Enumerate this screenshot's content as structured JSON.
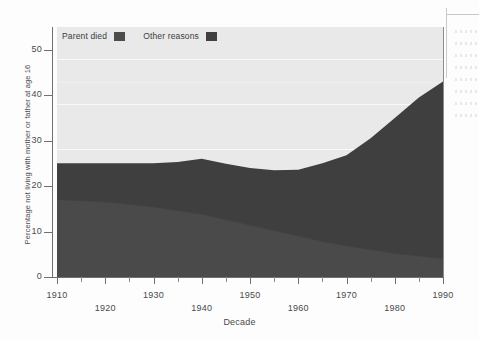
{
  "figure": {
    "ytitle": "Percentage not living with mother or father at age 16",
    "xtitle": "Decade"
  },
  "legend": {
    "items": [
      {
        "label": "Parent died",
        "color": "#4c4c4c",
        "swatch_name": "legend-swatch-parent-died"
      },
      {
        "label": "Other reasons",
        "color": "#3f3f3f",
        "swatch_name": "legend-swatch-other-reasons"
      }
    ]
  },
  "axes": {
    "y_ticks": [
      "0",
      "10",
      "20",
      "30",
      "40",
      "50"
    ],
    "x_ticks": [
      "1910",
      "1920",
      "1930",
      "1940",
      "1950",
      "1960",
      "1970",
      "1980",
      "1990"
    ]
  },
  "chart_data": {
    "type": "area",
    "title": "",
    "subtitle": "",
    "xlabel": "Decade",
    "ylabel": "Percentage not living with mother or father at age 16",
    "xlim": [
      1910,
      1990
    ],
    "ylim": [
      0,
      55
    ],
    "grid": true,
    "legend_position": "top-left",
    "stacked": true,
    "categories": [
      1910,
      1915,
      1920,
      1925,
      1930,
      1935,
      1940,
      1945,
      1950,
      1955,
      1960,
      1965,
      1970,
      1975,
      1980,
      1985,
      1990
    ],
    "series": [
      {
        "name": "Parent died",
        "color": "#4c4c4c",
        "values": [
          17.0,
          16.8,
          16.5,
          16.0,
          15.4,
          14.6,
          13.8,
          12.6,
          11.4,
          10.2,
          9.0,
          7.8,
          6.8,
          6.0,
          5.2,
          4.6,
          4.0
        ]
      },
      {
        "name": "Other reasons",
        "color": "#3f3f3f",
        "values": [
          8.0,
          8.2,
          8.5,
          9.0,
          9.6,
          10.7,
          12.2,
          12.3,
          12.6,
          13.3,
          14.6,
          17.2,
          20.0,
          24.5,
          29.8,
          34.9,
          39.0
        ]
      }
    ],
    "totals": [
      25.0,
      25.0,
      25.0,
      25.0,
      25.0,
      25.3,
      26.0,
      24.9,
      24.0,
      23.5,
      23.6,
      25.0,
      26.8,
      30.5,
      35.0,
      39.5,
      43.0
    ],
    "y_gridlines": [
      10,
      20,
      30,
      40,
      50
    ]
  }
}
